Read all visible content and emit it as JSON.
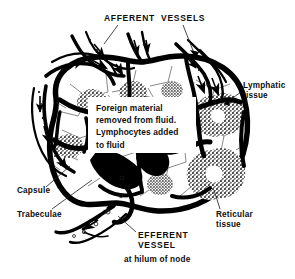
{
  "figure": {
    "background_color": "#ffffff",
    "ink_color": "#000000",
    "tissue_fill_color": "#5a5a5a"
  },
  "labels": {
    "afferent_vessels": "AFFERENT  VESSELS",
    "lymphatic_tissue": "Lymphatic\ntissue",
    "reticular_tissue": "Reticular\ntissue",
    "capsule": "Capsule",
    "trabeculae": "Trabeculae",
    "efferent_vessel": "EFFERENT\nVESSEL",
    "hilum_note": "at hilum of node"
  },
  "callout": {
    "lines": [
      "Foreign material",
      "removed from fluid.",
      "Lymphocytes added",
      "to fluid"
    ],
    "text": "Foreign material\nremoved from fluid.\nLymphocytes added\nto fluid"
  }
}
